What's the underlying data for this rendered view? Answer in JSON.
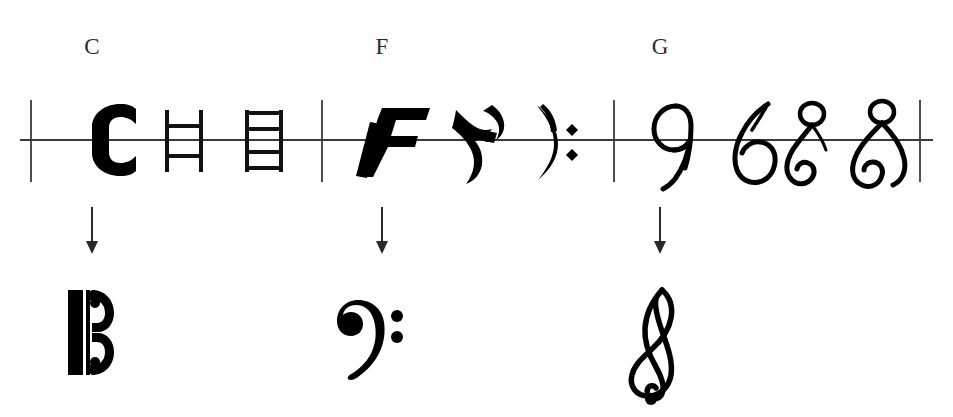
{
  "figure": {
    "background_color": "#ffffff",
    "ink_color": "#000000",
    "line_color": "#333333"
  },
  "groups": [
    {
      "id": "c-group",
      "letter": "C",
      "letter_label": "C",
      "label_x": 92,
      "divider_left_x": 31,
      "divider_right_x": 322,
      "arrow_x": 92,
      "result_name": "alto-clef",
      "result_label": "C clef",
      "stages": [
        {
          "name": "blackletter-c",
          "x": 104,
          "description": "bold gothic letter C"
        },
        {
          "name": "square-c-two-bar",
          "x": 185,
          "description": "squared C with two crossbars"
        },
        {
          "name": "square-c-four-bar",
          "x": 265,
          "description": "squared C with four crossbars"
        }
      ]
    },
    {
      "id": "f-group",
      "letter": "F",
      "letter_label": "F",
      "label_x": 382,
      "divider_left_x": 322,
      "divider_right_x": 614,
      "arrow_x": 382,
      "result_name": "bass-clef",
      "result_label": "F clef",
      "stages": [
        {
          "name": "italic-f",
          "x": 388,
          "description": "slanted roman letter F"
        },
        {
          "name": "calligraphic-f",
          "x": 478,
          "description": "cursive gothic F"
        },
        {
          "name": "proto-bass-clef",
          "x": 556,
          "description": "curved F with two dots"
        }
      ]
    },
    {
      "id": "g-group",
      "letter": "G",
      "letter_label": "G",
      "label_x": 660,
      "divider_left_x": 614,
      "divider_right_x": 920,
      "arrow_x": 660,
      "result_name": "treble-clef",
      "result_label": "G clef",
      "stages": [
        {
          "name": "script-g-open",
          "x": 666,
          "description": "open script letter G"
        },
        {
          "name": "script-g-loop",
          "x": 740,
          "description": "looped script G"
        },
        {
          "name": "script-g-curl",
          "x": 812,
          "description": "G with upper loop and lower curl"
        },
        {
          "name": "script-g-double-loop",
          "x": 882,
          "description": "G with full upper loop and lower curl"
        }
      ]
    }
  ],
  "staff": {
    "baseline_y": 140,
    "line_left_x": 20,
    "line_right_x": 933,
    "divider_top_y": 100,
    "divider_bottom_y": 182
  },
  "arrows": {
    "top_y": 207,
    "bottom_y": 252,
    "head_size": 8
  },
  "results": [
    {
      "name": "alto-clef-final",
      "x": 90,
      "y": 330,
      "label": "C clef (alto)"
    },
    {
      "name": "bass-clef-final",
      "x": 385,
      "y": 330,
      "label": "F clef (bass)"
    },
    {
      "name": "treble-clef-final",
      "x": 663,
      "y": 330,
      "label": "G clef (treble)"
    }
  ]
}
